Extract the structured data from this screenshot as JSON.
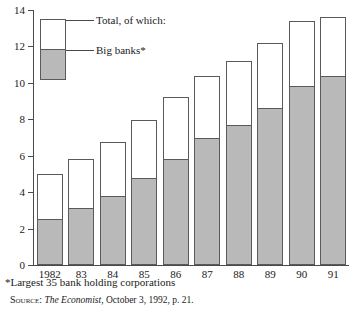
{
  "chart_data": {
    "type": "bar",
    "stacked": true,
    "title": "",
    "subtitle": "",
    "xlabel": "",
    "ylabel": "",
    "categories": [
      "1982",
      "83",
      "84",
      "85",
      "86",
      "87",
      "88",
      "89",
      "90",
      "91"
    ],
    "series": [
      {
        "name": "Big banks*",
        "values": [
          2.5,
          3.15,
          3.8,
          4.75,
          5.8,
          7.0,
          7.7,
          8.6,
          9.85,
          10.4
        ],
        "color": "#b9b9b9"
      },
      {
        "name": "Total, of which:",
        "values": [
          5.0,
          5.8,
          6.75,
          7.95,
          9.2,
          10.4,
          11.2,
          12.2,
          13.4,
          13.6
        ],
        "color": "#ffffff"
      }
    ],
    "ylim": [
      0,
      14
    ],
    "yticks": [
      0,
      2,
      4,
      6,
      8,
      10,
      12,
      14
    ],
    "ytick_labels": [
      "0",
      "2",
      "4",
      "6",
      "8",
      "10",
      "12",
      "14"
    ],
    "grid": false,
    "legend_position": "inside-upper-left"
  },
  "legend": {
    "total_label": "Total, of which:",
    "big_banks_label": "Big banks*"
  },
  "footnote": "*Largest 35 bank holding corporations",
  "source": {
    "prefix": "Source:",
    "publication": "The Economist",
    "rest": ", October 3, 1992, p. 21."
  },
  "colors": {
    "big_banks_fill": "#b9b9b9",
    "total_fill": "#ffffff",
    "outline": "#5a5a5a",
    "axis": "#4a4a4a"
  }
}
